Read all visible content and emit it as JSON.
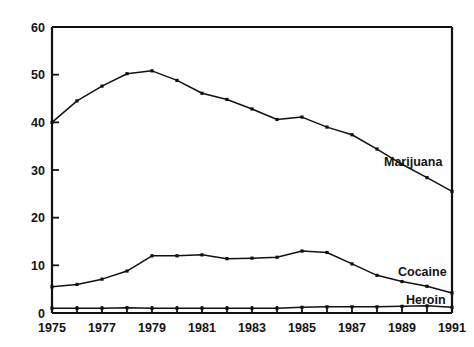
{
  "chart_data": {
    "type": "line",
    "title": "",
    "subtitle": "",
    "xlabel": "",
    "ylabel": "",
    "xlim": [
      1975,
      1991
    ],
    "ylim": [
      0,
      60
    ],
    "grid": false,
    "legend_position": "inline-right-end-of-line",
    "y_ticks": [
      0,
      10,
      20,
      30,
      40,
      50,
      60
    ],
    "y_tick_labels": [
      "0",
      "10",
      "20",
      "30",
      "40",
      "50",
      "60"
    ],
    "x_ticks": [
      1975,
      1976,
      1977,
      1978,
      1979,
      1980,
      1981,
      1982,
      1983,
      1984,
      1985,
      1986,
      1987,
      1988,
      1989,
      1990,
      1991
    ],
    "x_tick_labels": [
      "1975",
      "",
      "1977",
      "",
      "1979",
      "",
      "1981",
      "",
      "1983",
      "",
      "1985",
      "",
      "1987",
      "",
      "1989",
      "",
      "1991"
    ],
    "x_labeled_ticks": [
      "1975",
      "1977",
      "1979",
      "1981",
      "1983",
      "1985",
      "1987",
      "1989",
      "1991"
    ],
    "x": [
      1975,
      1976,
      1977,
      1978,
      1979,
      1980,
      1981,
      1982,
      1983,
      1984,
      1985,
      1986,
      1987,
      1988,
      1989,
      1990,
      1991
    ],
    "series": [
      {
        "name": "Marijuana",
        "color": "#111111",
        "values": [
          40.0,
          44.5,
          47.6,
          50.2,
          50.8,
          48.8,
          46.1,
          44.8,
          42.8,
          40.6,
          41.1,
          39.0,
          37.4,
          34.4,
          31.2,
          28.4,
          25.5
        ]
      },
      {
        "name": "Cocaine",
        "color": "#111111",
        "values": [
          5.5,
          6.0,
          7.1,
          8.8,
          12.0,
          12.0,
          12.2,
          11.4,
          11.5,
          11.7,
          13.0,
          12.7,
          10.3,
          7.9,
          6.6,
          5.6,
          4.2
        ]
      },
      {
        "name": "Heroin",
        "color": "#111111",
        "values": [
          1.0,
          1.0,
          1.0,
          1.1,
          1.0,
          1.0,
          1.0,
          1.0,
          1.0,
          1.0,
          1.2,
          1.3,
          1.3,
          1.3,
          1.4,
          1.5,
          1.2
        ]
      }
    ]
  },
  "axes": {
    "y_title": "",
    "x_title": ""
  },
  "series_labels": {
    "marijuana": "Marijuana",
    "cocaine": "Cocaine",
    "heroin": "Heroin"
  },
  "colors": {
    "ink": "#111111",
    "background": "#ffffff"
  }
}
